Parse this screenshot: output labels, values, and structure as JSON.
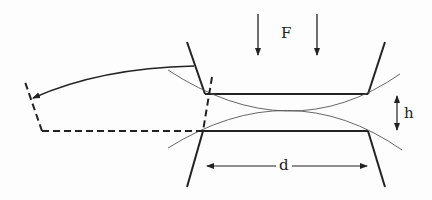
{
  "diagram": {
    "labels": {
      "force": "F",
      "height": "h",
      "distance": "d"
    },
    "colors": {
      "line": "#222222",
      "thin_curve": "#555555",
      "background": "#fdfdfd"
    }
  }
}
